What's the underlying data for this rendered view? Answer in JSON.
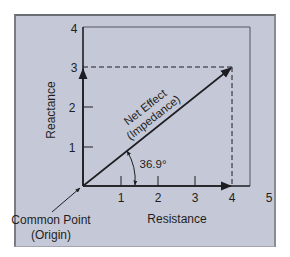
{
  "diagram": {
    "type": "impedance-vector-diagram",
    "y_axis": {
      "label": "Reactance",
      "ticks": [
        "1",
        "2",
        "3",
        "4"
      ]
    },
    "x_axis": {
      "label": "Resistance",
      "ticks": [
        "1",
        "2",
        "3",
        "4",
        "5"
      ]
    },
    "vector": {
      "label_line1": "Net Effect",
      "label_line2": "(Impedance)",
      "from": [
        0,
        0
      ],
      "to": [
        4,
        3
      ]
    },
    "angle": {
      "label": "36.9°",
      "degrees": 36.9
    },
    "origin": {
      "label_line1": "Common Point",
      "label_line2": "(Origin)"
    },
    "colors": {
      "panel": "#c5c9d7",
      "ink": "#1e1e22"
    }
  }
}
